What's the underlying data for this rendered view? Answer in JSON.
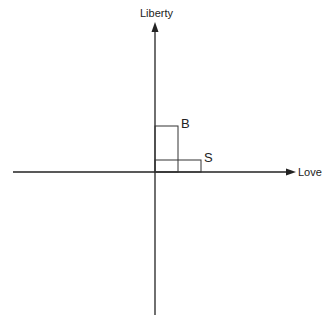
{
  "diagram": {
    "axes": {
      "vertical_label": "Liberty",
      "horizontal_label": "Love"
    },
    "boxes": [
      {
        "label": "B",
        "x0": 154,
        "y0": 126,
        "x1": 178,
        "y1": 172
      },
      {
        "label": "S",
        "x0": 154,
        "y0": 160,
        "x1": 201,
        "y1": 172
      }
    ],
    "colors": {
      "line": "#222222",
      "background": "#ffffff"
    }
  }
}
